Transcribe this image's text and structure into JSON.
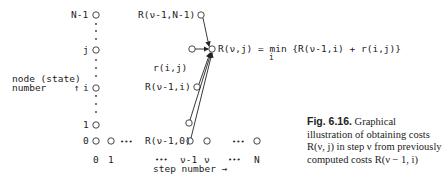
{
  "diagram": {
    "row_labels": [
      "N-1",
      "j",
      "i",
      "1",
      "0"
    ],
    "row_axis_label_1": "node (state)",
    "row_axis_label_2": "number",
    "row_arrow": "↑",
    "col_labels": [
      "0",
      "1",
      "•••",
      "ν-1",
      "ν",
      "•••",
      "N"
    ],
    "col_axis_label": "step number →",
    "node_labels": {
      "top": "R(ν-1,N-1)",
      "mid_i": "R(ν-1,i)",
      "bottom": "R(ν-1,0)",
      "edge": "r(i,j)",
      "bottom_dots": "•••"
    },
    "equation": {
      "lhs": "R(ν,j) = min {R(ν-1,i) + r(i,j)}",
      "sub": "i"
    }
  },
  "caption": {
    "figure_label": "Fig. 6.16.",
    "text": " Graphical illustration of obtaining costs R(ν, j) in step ν from previously computed costs R(ν − 1, i)"
  }
}
